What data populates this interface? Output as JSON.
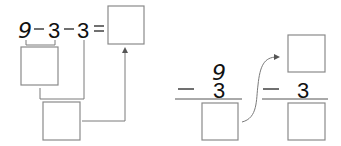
{
  "left_diagram": {
    "expression": {
      "operand1": "9",
      "op1": "−",
      "operand2": "3",
      "op2": "−",
      "operand3": "3",
      "equals": "="
    },
    "answer_box": "",
    "intermediate_box": "",
    "second_step_box": ""
  },
  "right_diagram": {
    "step1": {
      "top": "9",
      "operator": "−",
      "subtrahend": "3",
      "result_box": ""
    },
    "step2": {
      "top_box": "",
      "operator": "−",
      "subtrahend": "3",
      "result_box": ""
    }
  },
  "colors": {
    "box_stroke": "#8a8a8a",
    "line": "#7a7a7a",
    "text": "#111111"
  }
}
